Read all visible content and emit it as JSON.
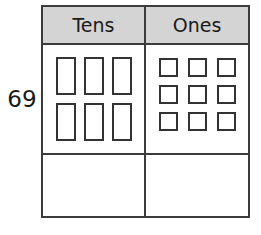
{
  "worksheet": {
    "number_label": "69",
    "table": {
      "headers": {
        "tens": "Tens",
        "ones": "Ones"
      },
      "header_background": "#d4d4d4",
      "border_color": "#3b3b3b",
      "block_outline_color": "#333333",
      "blocks": {
        "tens_rod_count": 6,
        "ones_unit_count": 9,
        "tens_rods_layout": "3 per row, 2 rows",
        "ones_units_layout": "3 per row, 3 rows"
      },
      "answer_row": {
        "tens_value": "",
        "ones_value": ""
      }
    }
  }
}
